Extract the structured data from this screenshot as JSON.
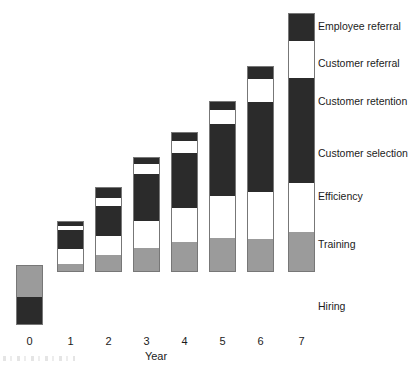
{
  "chart_data": {
    "type": "bar",
    "subtype": "stacked-bar",
    "title": "",
    "xlabel": "Year",
    "ylabel": "",
    "grid": false,
    "legend_position": "right-inline",
    "categories": [
      "0",
      "1",
      "2",
      "3",
      "4",
      "5",
      "6",
      "7"
    ],
    "series": [
      {
        "name": "Hiring",
        "color": "#2b2b2b",
        "values": [
          28,
          0,
          0,
          0,
          0,
          0,
          0,
          0
        ]
      },
      {
        "name": "Training",
        "color": "#9b9b9b",
        "values": [
          32,
          8,
          17,
          24,
          30,
          34,
          38,
          40
        ]
      },
      {
        "name": "Efficiency",
        "color": "#ffffff",
        "values": [
          0,
          15,
          19,
          27,
          34,
          42,
          47,
          49
        ]
      },
      {
        "name": "Customer selection",
        "color": "#2b2b2b",
        "values": [
          0,
          19,
          30,
          47,
          55,
          72,
          90,
          105
        ]
      },
      {
        "name": "Customer retention",
        "color": "#2b2b2b",
        "values": [
          0,
          0,
          0,
          0,
          0,
          0,
          0,
          0
        ]
      },
      {
        "name": "Customer referral",
        "color": "#ffffff",
        "values": [
          0,
          4,
          8,
          10,
          12,
          14,
          23,
          37
        ]
      },
      {
        "name": "Employee referral",
        "color": "#2b2b2b",
        "values": [
          0,
          5,
          11,
          7,
          9,
          9,
          13,
          28
        ]
      }
    ],
    "totals": [
      60,
      51,
      85,
      115,
      140,
      171,
      211,
      259
    ]
  },
  "axis": {
    "x_title": "Year",
    "ticks": [
      "0",
      "1",
      "2",
      "3",
      "4",
      "5",
      "6",
      "7"
    ]
  },
  "legend": {
    "items": [
      {
        "label": "Employee referral"
      },
      {
        "label": "Customer referral"
      },
      {
        "label": "Customer retention"
      },
      {
        "label": "Customer selection"
      },
      {
        "label": "Efficiency"
      },
      {
        "label": "Training"
      },
      {
        "label": "Hiring"
      }
    ]
  },
  "bars": [
    {
      "year": "0",
      "segments": [
        {
          "name": "Training",
          "fill": "gray",
          "top": 265,
          "height": 32
        },
        {
          "name": "Hiring",
          "fill": "black",
          "top": 297,
          "height": 28
        }
      ]
    },
    {
      "year": "1",
      "segments": [
        {
          "name": "Employee referral",
          "fill": "black",
          "top": 221,
          "height": 5
        },
        {
          "name": "Customer referral",
          "fill": "white",
          "top": 226,
          "height": 4
        },
        {
          "name": "Customer selection",
          "fill": "black",
          "top": 230,
          "height": 19
        },
        {
          "name": "Efficiency",
          "fill": "white",
          "top": 249,
          "height": 15
        },
        {
          "name": "Training",
          "fill": "gray",
          "top": 264,
          "height": 8
        }
      ]
    },
    {
      "year": "2",
      "segments": [
        {
          "name": "Employee referral",
          "fill": "black",
          "top": 187,
          "height": 11
        },
        {
          "name": "Customer referral",
          "fill": "white",
          "top": 198,
          "height": 8
        },
        {
          "name": "Customer selection",
          "fill": "black",
          "top": 206,
          "height": 30
        },
        {
          "name": "Efficiency",
          "fill": "white",
          "top": 236,
          "height": 19
        },
        {
          "name": "Training",
          "fill": "gray",
          "top": 255,
          "height": 17
        }
      ]
    },
    {
      "year": "3",
      "segments": [
        {
          "name": "Employee referral",
          "fill": "black",
          "top": 157,
          "height": 7
        },
        {
          "name": "Customer referral",
          "fill": "white",
          "top": 164,
          "height": 10
        },
        {
          "name": "Customer selection",
          "fill": "black",
          "top": 174,
          "height": 47
        },
        {
          "name": "Efficiency",
          "fill": "white",
          "top": 221,
          "height": 27
        },
        {
          "name": "Training",
          "fill": "gray",
          "top": 248,
          "height": 24
        }
      ]
    },
    {
      "year": "4",
      "segments": [
        {
          "name": "Employee referral",
          "fill": "black",
          "top": 132,
          "height": 9
        },
        {
          "name": "Customer referral",
          "fill": "white",
          "top": 141,
          "height": 12
        },
        {
          "name": "Customer selection",
          "fill": "black",
          "top": 153,
          "height": 55
        },
        {
          "name": "Efficiency",
          "fill": "white",
          "top": 208,
          "height": 34
        },
        {
          "name": "Training",
          "fill": "gray",
          "top": 242,
          "height": 30
        }
      ]
    },
    {
      "year": "5",
      "segments": [
        {
          "name": "Employee referral",
          "fill": "black",
          "top": 101,
          "height": 9
        },
        {
          "name": "Customer referral",
          "fill": "white",
          "top": 110,
          "height": 14
        },
        {
          "name": "Customer selection",
          "fill": "black",
          "top": 124,
          "height": 72
        },
        {
          "name": "Efficiency",
          "fill": "white",
          "top": 196,
          "height": 42
        },
        {
          "name": "Training",
          "fill": "gray",
          "top": 238,
          "height": 34
        }
      ]
    },
    {
      "year": "6",
      "segments": [
        {
          "name": "Employee referral",
          "fill": "black",
          "top": 66,
          "height": 13
        },
        {
          "name": "Customer referral",
          "fill": "white",
          "top": 79,
          "height": 23
        },
        {
          "name": "Customer selection",
          "fill": "black",
          "top": 102,
          "height": 90
        },
        {
          "name": "Efficiency",
          "fill": "white",
          "top": 192,
          "height": 47
        },
        {
          "name": "Training",
          "fill": "gray",
          "top": 239,
          "height": 33
        }
      ]
    },
    {
      "year": "7",
      "segments": [
        {
          "name": "Employee referral",
          "fill": "black",
          "top": 13,
          "height": 28
        },
        {
          "name": "Customer referral",
          "fill": "white",
          "top": 41,
          "height": 37
        },
        {
          "name": "Customer selection",
          "fill": "black",
          "top": 78,
          "height": 105
        },
        {
          "name": "Efficiency",
          "fill": "white",
          "top": 183,
          "height": 49
        },
        {
          "name": "Training",
          "fill": "gray",
          "top": 232,
          "height": 40
        }
      ]
    }
  ],
  "layout": {
    "bar_lefts": [
      16,
      57,
      95,
      133,
      171,
      209,
      247,
      288
    ],
    "bar_width": 27,
    "tick_y": 335,
    "axis_title_y": 350,
    "legend_x": 318,
    "legend_ys": [
      20,
      57,
      95,
      147,
      190,
      238,
      300
    ]
  },
  "colors": {
    "black": "#2b2b2b",
    "white": "#ffffff",
    "gray": "#9b9b9b",
    "outline": "#777777",
    "text": "#1b1b1b",
    "background": "#ffffff"
  }
}
